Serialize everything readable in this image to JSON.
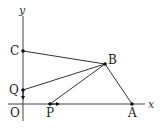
{
  "diagram": {
    "type": "geometry-coordinate-figure",
    "axes": {
      "x_label": "x",
      "y_label": "y",
      "origin_label": "O"
    },
    "points": {
      "C": {
        "label": "C",
        "on": "y-axis"
      },
      "Q": {
        "label": "Q",
        "on": "y-axis"
      },
      "P": {
        "label": "P",
        "on": "x-axis"
      },
      "A": {
        "label": "A",
        "on": "x-axis"
      },
      "B": {
        "label": "B",
        "on": "plane"
      }
    },
    "segments": [
      "C-B",
      "B-A",
      "Q-B",
      "P-B"
    ],
    "arrows": [
      {
        "at": "Q",
        "direction": "down",
        "note": "Q moves along y-axis"
      },
      {
        "at": "P",
        "direction": "right",
        "note": "P moves along x-axis"
      }
    ],
    "colors": {
      "line": "#333333",
      "point": "#111111",
      "background": "#ffffff"
    }
  }
}
